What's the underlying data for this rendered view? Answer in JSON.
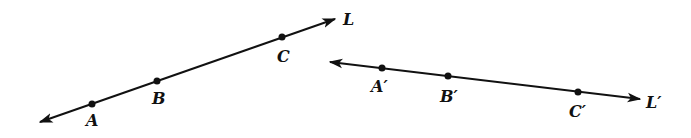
{
  "diagram": {
    "lines": [
      {
        "name": "L",
        "label": "L",
        "start": [
          40,
          122
        ],
        "end": [
          335,
          19
        ],
        "label_pos": [
          343,
          25
        ],
        "points": [
          {
            "label": "A",
            "pos": [
              92,
              104
            ],
            "label_pos": [
              86,
              126
            ]
          },
          {
            "label": "B",
            "pos": [
              157,
              81
            ],
            "label_pos": [
              152,
              104
            ]
          },
          {
            "label": "C",
            "pos": [
              282,
              37
            ],
            "label_pos": [
              277,
              62
            ]
          }
        ]
      },
      {
        "name": "L'",
        "label": "L′",
        "start": [
          330,
          62
        ],
        "end": [
          640,
          99
        ],
        "label_pos": [
          646,
          108
        ],
        "points": [
          {
            "label": "A′",
            "pos": [
              382,
              68
            ],
            "label_pos": [
              371,
              92
            ]
          },
          {
            "label": "B′",
            "pos": [
              448,
              76
            ],
            "label_pos": [
              440,
              102
            ]
          },
          {
            "label": "C′",
            "pos": [
              578,
              92
            ],
            "label_pos": [
              569,
              117
            ]
          }
        ]
      }
    ],
    "colors": {
      "stroke": "#111111",
      "background": "#ffffff"
    }
  }
}
